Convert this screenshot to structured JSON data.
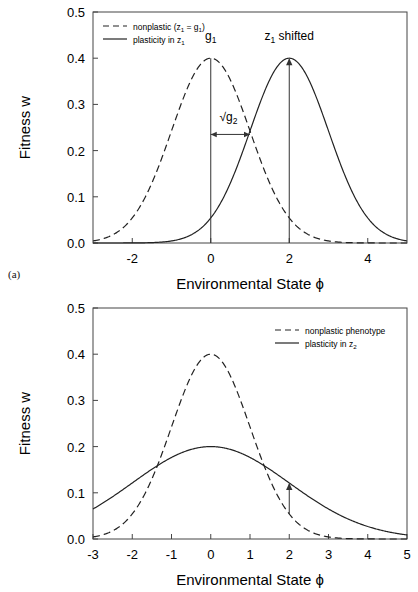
{
  "figure": {
    "panels": [
      {
        "tag": "(a)",
        "xlabel": "Environmental State ϕ",
        "ylabel": "Fitness w",
        "xticks": [
          "-2",
          "0",
          "2",
          "4"
        ],
        "yticks": [
          "0.0",
          "0.1",
          "0.2",
          "0.3",
          "0.4",
          "0.5"
        ],
        "legend": [
          {
            "style": "dashed",
            "label_pre": "nonplastic (z",
            "label_sub1": "1",
            "label_mid": " = g",
            "label_sub2": "1",
            "label_post": ")"
          },
          {
            "style": "solid",
            "label_pre": "plasticity in z",
            "label_sub1": "1",
            "label_mid": "",
            "label_sub2": "",
            "label_post": ""
          }
        ],
        "annotations": [
          {
            "name": "g1",
            "text_pre": "g",
            "text_sub": "1",
            "text_post": ""
          },
          {
            "name": "z1-shifted",
            "text_pre": "z",
            "text_sub": "1",
            "text_post": " shifted"
          },
          {
            "name": "sqrt-g2",
            "text_pre": "√g",
            "text_sub": "2",
            "text_post": ""
          }
        ]
      },
      {
        "tag": "(b)",
        "xlabel": "Environmental State ϕ",
        "ylabel": "Fitness w",
        "xticks": [
          "-3",
          "-2",
          "-1",
          "0",
          "1",
          "2",
          "3",
          "4",
          "5"
        ],
        "yticks": [
          "0.0",
          "0.1",
          "0.2",
          "0.3",
          "0.4",
          "0.5"
        ],
        "legend": [
          {
            "style": "dashed",
            "label_pre": "nonplastic phenotype",
            "label_sub1": "",
            "label_mid": "",
            "label_sub2": "",
            "label_post": ""
          },
          {
            "style": "solid",
            "label_pre": "plasticity in z",
            "label_sub1": "2",
            "label_mid": "",
            "label_sub2": "",
            "label_post": ""
          }
        ],
        "annotations": []
      }
    ]
  },
  "chart_data": [
    {
      "type": "line",
      "panel": "(a)",
      "title": "",
      "xlabel": "Environmental State ϕ",
      "ylabel": "Fitness w",
      "xlim": [
        -3,
        5
      ],
      "ylim": [
        0.0,
        0.5
      ],
      "xticks": [
        -2,
        0,
        2,
        4
      ],
      "yticks": [
        0.0,
        0.1,
        0.2,
        0.3,
        0.4,
        0.5
      ],
      "grid": false,
      "legend_position": "top-left",
      "series": [
        {
          "name": "nonplastic (z1 = g1)",
          "style": "dashed",
          "peak_x": 0.0,
          "peak_y": 0.4,
          "sigma": 1.0,
          "x": [
            -3,
            -2.5,
            -2,
            -1.5,
            -1,
            -0.5,
            0,
            0.5,
            1,
            1.5,
            2,
            2.5,
            3,
            3.5,
            4,
            4.5,
            5
          ],
          "values": [
            0.004,
            0.018,
            0.054,
            0.13,
            0.242,
            0.352,
            0.399,
            0.352,
            0.242,
            0.13,
            0.054,
            0.018,
            0.004,
            0.001,
            0.0,
            0.0,
            0.0
          ]
        },
        {
          "name": "plasticity in z1",
          "style": "solid",
          "peak_x": 2.0,
          "peak_y": 0.4,
          "sigma": 1.0,
          "x": [
            -3,
            -2.5,
            -2,
            -1.5,
            -1,
            -0.5,
            0,
            0.5,
            1,
            1.5,
            2,
            2.5,
            3,
            3.5,
            4,
            4.5,
            5
          ],
          "values": [
            0.0,
            0.0,
            0.0,
            0.001,
            0.004,
            0.018,
            0.054,
            0.13,
            0.242,
            0.352,
            0.399,
            0.352,
            0.242,
            0.13,
            0.054,
            0.018,
            0.004
          ]
        }
      ],
      "annotations": [
        {
          "label": "g1",
          "x": 0.0,
          "points_to_y": 0.4,
          "type": "vertical-line"
        },
        {
          "label": "z1 shifted",
          "x": 2.0,
          "points_to_y": 0.4,
          "type": "vertical-arrow"
        },
        {
          "label": "√g2",
          "from_x": 0.0,
          "to_x": 1.0,
          "y": 0.235,
          "type": "horizontal-double-arrow"
        }
      ]
    },
    {
      "type": "line",
      "panel": "(b)",
      "title": "",
      "xlabel": "Environmental State ϕ",
      "ylabel": "Fitness w",
      "xlim": [
        -3,
        5
      ],
      "ylim": [
        0.0,
        0.5
      ],
      "xticks": [
        -3,
        -2,
        -1,
        0,
        1,
        2,
        3,
        4,
        5
      ],
      "yticks": [
        0.0,
        0.1,
        0.2,
        0.3,
        0.4,
        0.5
      ],
      "grid": false,
      "legend_position": "top-right",
      "series": [
        {
          "name": "nonplastic phenotype",
          "style": "dashed",
          "peak_x": 0.0,
          "peak_y": 0.4,
          "sigma": 1.0,
          "x": [
            -3,
            -2.5,
            -2,
            -1.5,
            -1,
            -0.5,
            0,
            0.5,
            1,
            1.5,
            2,
            2.5,
            3,
            3.5,
            4,
            4.5,
            5
          ],
          "values": [
            0.004,
            0.018,
            0.054,
            0.13,
            0.242,
            0.352,
            0.399,
            0.352,
            0.242,
            0.13,
            0.054,
            0.018,
            0.004,
            0.001,
            0.0,
            0.0,
            0.0
          ]
        },
        {
          "name": "plasticity in z2",
          "style": "solid",
          "peak_x": 0.0,
          "peak_y": 0.2,
          "sigma": 2.0,
          "x": [
            -3,
            -2.5,
            -2,
            -1.5,
            -1,
            -0.5,
            0,
            0.5,
            1,
            1.5,
            2,
            2.5,
            3,
            3.5,
            4,
            4.5,
            5
          ],
          "values": [
            0.065,
            0.091,
            0.121,
            0.151,
            0.176,
            0.193,
            0.199,
            0.193,
            0.176,
            0.151,
            0.121,
            0.091,
            0.065,
            0.043,
            0.027,
            0.015,
            0.009
          ]
        }
      ],
      "annotations": [
        {
          "label": "",
          "x": 2.0,
          "from_y": 0.054,
          "to_y": 0.121,
          "type": "vertical-arrow"
        }
      ]
    }
  ]
}
